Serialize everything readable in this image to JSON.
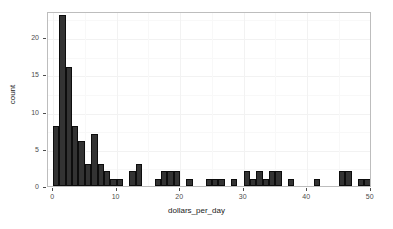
{
  "chart_data": {
    "type": "bar",
    "title": "",
    "subtitle": "",
    "xlabel": "dollars_per_day",
    "ylabel": "count",
    "xlim": [
      -0.8,
      50.2
    ],
    "ylim": [
      0,
      23.5
    ],
    "grid": true,
    "legend": null,
    "bin_width": 1,
    "bin_starts": [
      0,
      1,
      2,
      3,
      4,
      5,
      6,
      7,
      8,
      9,
      10,
      11,
      12,
      13,
      14,
      15,
      16,
      17,
      18,
      19,
      20,
      21,
      22,
      23,
      24,
      25,
      26,
      27,
      28,
      29,
      30,
      31,
      32,
      33,
      34,
      35,
      36,
      37,
      38,
      39,
      40,
      41,
      42,
      43,
      44,
      45,
      46,
      47,
      48,
      49
    ],
    "categories": [
      "0",
      "1",
      "2",
      "3",
      "4",
      "5",
      "6",
      "7",
      "8",
      "9",
      "10",
      "11",
      "12",
      "13",
      "14",
      "15",
      "16",
      "17",
      "18",
      "19",
      "20",
      "21",
      "22",
      "23",
      "24",
      "25",
      "26",
      "27",
      "28",
      "29",
      "30",
      "31",
      "32",
      "33",
      "34",
      "35",
      "36",
      "37",
      "38",
      "39",
      "40",
      "41",
      "42",
      "43",
      "44",
      "45",
      "46",
      "47",
      "48",
      "49"
    ],
    "values": [
      8,
      23,
      16,
      8,
      6,
      3,
      7,
      3,
      2,
      1,
      1,
      0,
      2,
      3,
      0,
      0,
      1,
      2,
      2,
      2,
      0,
      1,
      0,
      0,
      1,
      1,
      1,
      0,
      1,
      0,
      2,
      1,
      2,
      1,
      2,
      2,
      0,
      1,
      0,
      0,
      0,
      1,
      0,
      0,
      0,
      2,
      2,
      0,
      1,
      1
    ],
    "xticks": [
      0,
      10,
      20,
      30,
      40,
      50
    ],
    "xtick_labels": [
      "0",
      "10",
      "20",
      "30",
      "40",
      "50"
    ],
    "yticks": [
      0,
      5,
      10,
      15,
      20
    ],
    "ytick_labels": [
      "0",
      "5",
      "10",
      "15",
      "20"
    ],
    "bar_color": "#333333",
    "bar_edge_color": "#0d0d0d",
    "panel_background": "#ffffff",
    "panel_border_color": "#bdbdbd",
    "gridline_color": "#f2f2f2",
    "axis_text_color": "#4d4d4d"
  }
}
